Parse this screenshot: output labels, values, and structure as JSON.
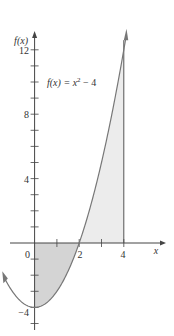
{
  "chart_data": {
    "type": "line",
    "title": "",
    "function_label": "f(x) = x² − 4",
    "xlabel": "x",
    "ylabel": "f(x)",
    "xlim": [
      -1.5,
      4.5
    ],
    "ylim": [
      -5,
      13
    ],
    "x_ticks": [
      0,
      1,
      2,
      3,
      4
    ],
    "x_tick_labels": [
      "0",
      "2",
      "4"
    ],
    "y_tick_labels": [
      "12",
      "8",
      "4",
      "-4"
    ],
    "series": [
      {
        "name": "f(x) = x^2 - 4",
        "points": [
          [
            -1.4,
            -2.04
          ],
          [
            0,
            -4
          ],
          [
            1,
            -3
          ],
          [
            2,
            0
          ],
          [
            3,
            5
          ],
          [
            4,
            12
          ],
          [
            4.1,
            12.81
          ]
        ]
      }
    ],
    "shaded_regions": [
      {
        "from": 0,
        "to": 2,
        "below_axis": true
      },
      {
        "from": 2,
        "to": 4,
        "below_axis": false
      }
    ],
    "vertical_line": {
      "x": 4
    }
  },
  "labels": {
    "ylabel": "f(x)",
    "xlabel": "x",
    "func_f": "f(x) = x",
    "func_exp": "2",
    "func_tail": " − 4",
    "y12": "12",
    "y8": "8",
    "y4": "4",
    "ym4": "−4",
    "x0": "0",
    "x2": "2",
    "x4": "4"
  }
}
